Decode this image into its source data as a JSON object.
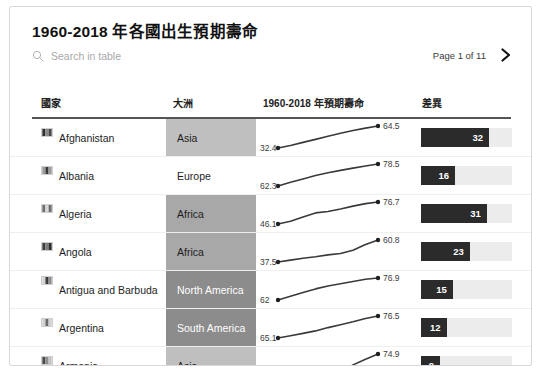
{
  "card": {
    "title": "1960-2018 年各國出生預期壽命"
  },
  "search": {
    "placeholder": "Search in table",
    "value": "",
    "icon": "search-icon"
  },
  "pagination": {
    "label": "Page 1 of 11",
    "next_icon": "chevron-right-icon",
    "current_page": 1,
    "total_pages": 11
  },
  "table": {
    "columns": [
      {
        "key": "country",
        "label": "國家"
      },
      {
        "key": "continent",
        "label": "大洲"
      },
      {
        "key": "life",
        "label": "1960-2018 年預期壽命"
      },
      {
        "key": "diff",
        "label": "差異"
      }
    ],
    "rows": [
      {
        "country": "Afghanistan",
        "flag_icon": "flag-afghanistan-icon",
        "continent": "Asia",
        "continent_shade": "#bfbfbf",
        "continent_text": "#1e1e1e",
        "start_value": "32.4",
        "end_value": "64.5",
        "sparkline": [
          32.4,
          36.0,
          40.5,
          45.0,
          49.5,
          54.0,
          58.0,
          61.5,
          64.5
        ],
        "diff": "32",
        "diff_value": 32
      },
      {
        "country": "Albania",
        "flag_icon": "flag-albania-icon",
        "continent": "Europe",
        "continent_shade": "#ffffff",
        "continent_text": "#1e1e1e",
        "start_value": "62.3",
        "end_value": "78.5",
        "sparkline": [
          62.3,
          65.0,
          67.5,
          70.0,
          72.0,
          73.8,
          75.5,
          77.0,
          78.5
        ],
        "diff": "16",
        "diff_value": 16
      },
      {
        "country": "Algeria",
        "flag_icon": "flag-algeria-icon",
        "continent": "Africa",
        "continent_shade": "#a8a8a8",
        "continent_text": "#1e1e1e",
        "start_value": "46.1",
        "end_value": "76.7",
        "sparkline": [
          46.1,
          50.0,
          56.0,
          61.5,
          63.5,
          67.0,
          71.0,
          74.5,
          76.7
        ],
        "diff": "31",
        "diff_value": 31
      },
      {
        "country": "Angola",
        "flag_icon": "flag-angola-icon",
        "continent": "Africa",
        "continent_shade": "#a8a8a8",
        "continent_text": "#1e1e1e",
        "start_value": "37.5",
        "end_value": "60.8",
        "sparkline": [
          37.5,
          39.5,
          41.5,
          43.0,
          45.0,
          46.5,
          50.0,
          56.0,
          60.8
        ],
        "diff": "23",
        "diff_value": 23
      },
      {
        "country": "Antigua and Barbuda",
        "flag_icon": "flag-antigua-and-barbuda-icon",
        "continent": "North America",
        "continent_shade": "#8c8c8c",
        "continent_text": "#ffffff",
        "start_value": "62",
        "end_value": "76.9",
        "sparkline": [
          62.0,
          64.5,
          67.0,
          69.5,
          71.5,
          73.0,
          74.5,
          76.0,
          76.9
        ],
        "diff": "15",
        "diff_value": 15
      },
      {
        "country": "Argentina",
        "flag_icon": "flag-argentina-icon",
        "continent": "South America",
        "continent_shade": "#8c8c8c",
        "continent_text": "#ffffff",
        "start_value": "65.1",
        "end_value": "76.5",
        "sparkline": [
          65.1,
          66.3,
          67.5,
          68.8,
          70.5,
          72.0,
          73.5,
          75.2,
          76.5
        ],
        "diff": "12",
        "diff_value": 12
      },
      {
        "country": "Armenia",
        "flag_icon": "flag-armenia-icon",
        "continent": "Asia",
        "continent_shade": "#bfbfbf",
        "continent_text": "#1e1e1e",
        "start_value": "66",
        "end_value": "74.9",
        "sparkline": [
          66.0,
          68.5,
          69.2,
          69.6,
          68.0,
          67.2,
          70.5,
          72.8,
          74.9
        ],
        "diff": "9",
        "diff_value": 9
      }
    ]
  },
  "style": {
    "bar_fill": "#2b2b2b",
    "bar_track": "#ececec",
    "spark_line": "#3a3a3a",
    "rule": "#555555"
  }
}
